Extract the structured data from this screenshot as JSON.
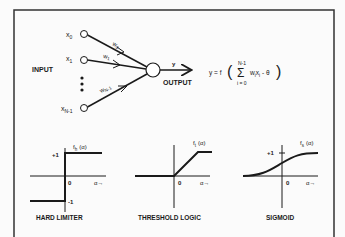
{
  "diagram": {
    "colors": {
      "ink": "#1a1a1a",
      "background": "#fbfbfb"
    },
    "neuron": {
      "input_label": "INPUT",
      "output_label": "OUTPUT",
      "output_symbol": "y",
      "inputs": [
        {
          "symbol": "x",
          "subscript": "0",
          "weight": "w",
          "weight_subscript": "0"
        },
        {
          "symbol": "x",
          "subscript": "1",
          "weight": "w",
          "weight_subscript": "1"
        },
        {
          "symbol": "x",
          "subscript": "N-1",
          "weight": "w",
          "weight_subscript": "N-1"
        }
      ],
      "ellipsis": "•••"
    },
    "formula": {
      "lhs": "y = f",
      "sum_upper": "N-1",
      "sum_lower": "i = 0",
      "sum_symbol": "Σ",
      "term": "w",
      "term_sub": "i",
      "term2": "x",
      "term2_sub": "i",
      "minus_theta": "- θ"
    },
    "graphs": [
      {
        "name": "HARD LIMITER",
        "fn_label": "f",
        "fn_sub": "h",
        "fn_arg": "(α)",
        "plus_one": "+1",
        "minus_one": "-1",
        "zero": "0",
        "axis_label": "α→"
      },
      {
        "name": "THRESHOLD LOGIC",
        "fn_label": "f",
        "fn_sub": "t",
        "fn_arg": "(α)",
        "zero": "0",
        "axis_label": "α→"
      },
      {
        "name": "SIGMOID",
        "fn_label": "f",
        "fn_sub": "s",
        "fn_arg": "(α)",
        "plus_one": "+1",
        "zero": "0",
        "axis_label": "α→"
      }
    ]
  }
}
